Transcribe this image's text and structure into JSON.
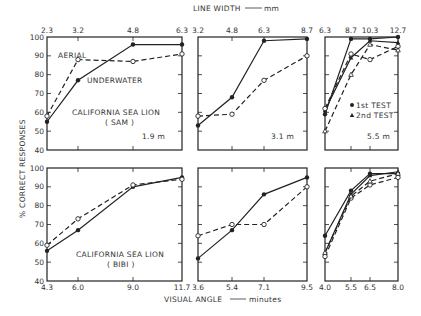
{
  "chart_data": {
    "type": "line",
    "title": "",
    "top_axis_label": "LINE WIDTH — mm",
    "bottom_axis_label": "VISUAL ANGLE — minutes",
    "ylabel": "% CORRECT RESPONSES",
    "ylim": [
      40,
      100
    ],
    "yticks": [
      40,
      50,
      60,
      70,
      80,
      90,
      100
    ],
    "legend": [
      {
        "label": "1st TEST",
        "marker": "filled-circle"
      },
      {
        "label": "2nd TEST",
        "marker": "triangle"
      }
    ],
    "panels": [
      {
        "id": "sam-1.9m",
        "row": "top",
        "annotation": "CALIFORNIA SEA LION",
        "annotation2": "(SAM)",
        "distance": "1.9 m",
        "x_ticks": [
          "2.3",
          "3.2",
          "4.8",
          "6.3"
        ],
        "series": [
          {
            "name": "UNDERWATER",
            "style": "solid",
            "marker": "filled",
            "values": [
              55,
              77,
              96,
              96
            ]
          },
          {
            "name": "AERIAL",
            "style": "dashed",
            "marker": "open",
            "values": [
              58,
              88,
              87,
              91
            ]
          }
        ]
      },
      {
        "id": "sam-3.1m",
        "row": "top",
        "distance": "3.1 m",
        "x_ticks": [
          "3.2",
          "4.8",
          "6.3",
          "8.7"
        ],
        "series": [
          {
            "name": "UNDERWATER",
            "style": "solid",
            "marker": "filled",
            "values": [
              53,
              68,
              98,
              99
            ]
          },
          {
            "name": "AERIAL",
            "style": "dashed",
            "marker": "open",
            "values": [
              58,
              59,
              77,
              90
            ]
          }
        ]
      },
      {
        "id": "sam-5.5m",
        "row": "top",
        "distance": "5.5 m",
        "x_ticks": [
          "6.3",
          "8.7",
          "10.3",
          "12.7"
        ],
        "series": [
          {
            "name": "UNDERWATER 1st TEST",
            "style": "solid",
            "marker": "filled",
            "values": [
              59,
              99,
              99,
              100
            ]
          },
          {
            "name": "UNDERWATER 2nd TEST",
            "style": "solid",
            "marker": "triangle",
            "values": [
              61,
              89,
              98,
              97
            ]
          },
          {
            "name": "AERIAL 1st TEST",
            "style": "dashed",
            "marker": "open",
            "values": [
              62,
              91,
              88,
              95
            ]
          },
          {
            "name": "AERIAL 2nd TEST",
            "style": "dashed",
            "marker": "open-triangle",
            "values": [
              50,
              80,
              96,
              93
            ]
          }
        ]
      },
      {
        "id": "bibi-1",
        "row": "bottom",
        "annotation": "CALIFORNIA SEA LION",
        "annotation2": "(BIBI)",
        "x_ticks": [
          "4.3",
          "6.0",
          "9.0",
          "11.7"
        ],
        "series": [
          {
            "name": "UNDERWATER",
            "style": "solid",
            "marker": "filled",
            "values": [
              56,
              67,
              90,
              95
            ]
          },
          {
            "name": "AERIAL",
            "style": "dashed",
            "marker": "open",
            "values": [
              59,
              73,
              91,
              94
            ]
          }
        ]
      },
      {
        "id": "bibi-2",
        "row": "bottom",
        "x_ticks": [
          "3.6",
          "5.4",
          "7.1",
          "9.5"
        ],
        "series": [
          {
            "name": "UNDERWATER",
            "style": "solid",
            "marker": "filled",
            "values": [
              52,
              67,
              86,
              95
            ]
          },
          {
            "name": "AERIAL",
            "style": "dashed",
            "marker": "open",
            "values": [
              64,
              70,
              70,
              90
            ]
          }
        ]
      },
      {
        "id": "bibi-3",
        "row": "bottom",
        "x_ticks": [
          "4.0",
          "5.5",
          "6.5",
          "8.0"
        ],
        "series": [
          {
            "name": "UNDERWATER 1st TEST",
            "style": "solid",
            "marker": "filled",
            "values": [
              64,
              88,
              97,
              97
            ]
          },
          {
            "name": "UNDERWATER 2nd TEST",
            "style": "solid",
            "marker": "triangle",
            "values": [
              55,
              86,
              96,
              98
            ]
          },
          {
            "name": "AERIAL 1st TEST",
            "style": "dashed",
            "marker": "open",
            "values": [
              53,
              84,
              91,
              95
            ]
          },
          {
            "name": "AERIAL 2nd TEST",
            "style": "dashed",
            "marker": "open-triangle",
            "values": [
              55,
              85,
              93,
              97
            ]
          }
        ]
      }
    ]
  },
  "labels": {
    "aerial": "AERIAL",
    "underwater": "UNDERWATER",
    "sam_line1": "CALIFORNIA SEA LION",
    "sam_line2": "( SAM )",
    "bibi_line1": "CALIFORNIA SEA LION",
    "bibi_line2": "( BIBI )",
    "dist1": "1.9 m",
    "dist2": "3.1 m",
    "dist3": "5.5 m",
    "legend1": "1st TEST",
    "legend2": "2nd TEST",
    "top_axis": "LINE WIDTH",
    "top_axis_unit": "mm",
    "bottom_axis": "VISUAL ANGLE",
    "bottom_axis_unit": "minutes",
    "y_axis": "% CORRECT RESPONSES"
  }
}
